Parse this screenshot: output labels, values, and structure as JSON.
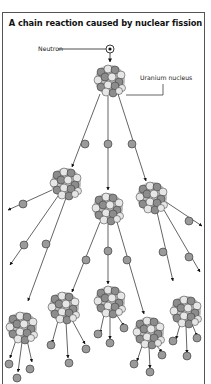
{
  "title": "A chain reaction caused by nuclear fission",
  "labels": {
    "neutron": "Neutron",
    "uranium_nucleus": "Uranium nucleus"
  },
  "colors": {
    "neutron_fill": "#9a9a9a",
    "nucleus_dark": "#8c8c8c",
    "nucleus_light": "#e6e6e6",
    "line": "#222222",
    "frame": "#555555"
  },
  "diagram": {
    "incoming_neutron": {
      "x": 110,
      "y": 49
    },
    "generations": [
      {
        "level": 1,
        "nuclei": [
          {
            "x": 110,
            "y": 80
          }
        ]
      },
      {
        "level": 2,
        "nuclei": [
          {
            "x": 66,
            "y": 183
          },
          {
            "x": 108,
            "y": 208
          },
          {
            "x": 152,
            "y": 197
          }
        ]
      },
      {
        "level": 3,
        "nuclei": [
          {
            "x": 22,
            "y": 327
          },
          {
            "x": 64,
            "y": 307
          },
          {
            "x": 110,
            "y": 301
          },
          {
            "x": 149,
            "y": 332
          },
          {
            "x": 186,
            "y": 311
          }
        ]
      }
    ]
  }
}
